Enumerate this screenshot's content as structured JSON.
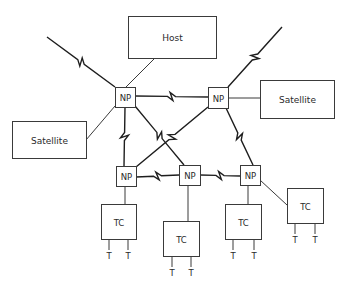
{
  "diagram": {
    "type": "network-topology",
    "nodes": [
      {
        "id": "host",
        "label": "Host",
        "kind": "box",
        "x": 128,
        "y": 16,
        "w": 88,
        "h": 42
      },
      {
        "id": "sat_left",
        "label": "Satellite",
        "kind": "box",
        "x": 12,
        "y": 121,
        "w": 74,
        "h": 37
      },
      {
        "id": "sat_right",
        "label": "Satellite",
        "kind": "box",
        "x": 260,
        "y": 80,
        "w": 74,
        "h": 38
      },
      {
        "id": "np1",
        "label": "NP",
        "kind": "np",
        "x": 115,
        "y": 87,
        "w": 20,
        "h": 20
      },
      {
        "id": "np2",
        "label": "NP",
        "kind": "np",
        "x": 208,
        "y": 87,
        "w": 20,
        "h": 21
      },
      {
        "id": "np3",
        "label": "NP",
        "kind": "np",
        "x": 116,
        "y": 166,
        "w": 20,
        "h": 20
      },
      {
        "id": "np4",
        "label": "NP",
        "kind": "np",
        "x": 179,
        "y": 165,
        "w": 21,
        "h": 20
      },
      {
        "id": "np5",
        "label": "NP",
        "kind": "np",
        "x": 240,
        "y": 165,
        "w": 20,
        "h": 20
      },
      {
        "id": "tc1",
        "label": "TC",
        "kind": "tc",
        "x": 101,
        "y": 204,
        "w": 35,
        "h": 35
      },
      {
        "id": "tc2",
        "label": "TC",
        "kind": "tc",
        "x": 163,
        "y": 221,
        "w": 36,
        "h": 35
      },
      {
        "id": "tc3",
        "label": "TC",
        "kind": "tc",
        "x": 225,
        "y": 204,
        "w": 36,
        "h": 35
      },
      {
        "id": "tc4",
        "label": "TC",
        "kind": "tc",
        "x": 287,
        "y": 188,
        "w": 36,
        "h": 35
      }
    ],
    "terminal_label": "T",
    "terminals": [
      {
        "tc": "tc1",
        "x": 109
      },
      {
        "tc": "tc1",
        "x": 128
      },
      {
        "tc": "tc2",
        "x": 172
      },
      {
        "tc": "tc2",
        "x": 191
      },
      {
        "tc": "tc3",
        "x": 233
      },
      {
        "tc": "tc3",
        "x": 254
      },
      {
        "tc": "tc4",
        "x": 295
      },
      {
        "tc": "tc4",
        "x": 315
      }
    ],
    "edges": [
      {
        "from": "external",
        "to": "np1",
        "kind": "wireless",
        "x1": 47,
        "y1": 37,
        "x2": 115,
        "y2": 87
      },
      {
        "from": "external",
        "to": "np2",
        "kind": "wireless",
        "x1": 282,
        "y1": 27,
        "x2": 228,
        "y2": 87
      },
      {
        "from": "host",
        "to": "np1",
        "kind": "wired",
        "x1": 155,
        "y1": 58,
        "x2": 126,
        "y2": 87
      },
      {
        "from": "sat_left",
        "to": "np1",
        "kind": "wired",
        "x1": 86,
        "y1": 140,
        "x2": 115,
        "y2": 106
      },
      {
        "from": "np2",
        "to": "sat_right",
        "kind": "wired",
        "x1": 228,
        "y1": 98,
        "x2": 260,
        "y2": 98
      },
      {
        "from": "np1",
        "to": "np2",
        "kind": "wireless",
        "x1": 135,
        "y1": 96,
        "x2": 208,
        "y2": 97
      },
      {
        "from": "np1",
        "to": "np3",
        "kind": "wireless",
        "x1": 125,
        "y1": 107,
        "x2": 124,
        "y2": 166
      },
      {
        "from": "np1",
        "to": "np4",
        "kind": "wireless",
        "x1": 135,
        "y1": 106,
        "x2": 184,
        "y2": 165
      },
      {
        "from": "np2",
        "to": "np3",
        "kind": "wireless",
        "x1": 208,
        "y1": 107,
        "x2": 136,
        "y2": 167
      },
      {
        "from": "np2",
        "to": "np5",
        "kind": "wireless",
        "x1": 226,
        "y1": 108,
        "x2": 253,
        "y2": 165
      },
      {
        "from": "np3",
        "to": "np4",
        "kind": "wireless",
        "x1": 136,
        "y1": 177,
        "x2": 179,
        "y2": 175
      },
      {
        "from": "np4",
        "to": "np5",
        "kind": "wireless",
        "x1": 200,
        "y1": 175,
        "x2": 240,
        "y2": 176
      },
      {
        "from": "np3",
        "to": "tc1",
        "kind": "wired",
        "x1": 125,
        "y1": 186,
        "x2": 125,
        "y2": 204
      },
      {
        "from": "np4",
        "to": "tc2",
        "kind": "wired",
        "x1": 188,
        "y1": 185,
        "x2": 188,
        "y2": 221
      },
      {
        "from": "np5",
        "to": "tc3",
        "kind": "wired",
        "x1": 248,
        "y1": 185,
        "x2": 248,
        "y2": 204
      },
      {
        "from": "np5",
        "to": "tc4",
        "kind": "wired",
        "x1": 260,
        "y1": 180,
        "x2": 287,
        "y2": 205
      }
    ],
    "colors": {
      "stroke": "#3a3a3a",
      "text": "#2a2a2a",
      "background": "#ffffff"
    }
  }
}
